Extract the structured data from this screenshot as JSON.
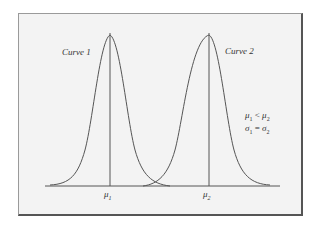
{
  "diagram": {
    "curves": [
      {
        "label": "Curve 1",
        "mean_label": "μ",
        "mean_sub": "1"
      },
      {
        "label": "Curve 2",
        "mean_label": "μ",
        "mean_sub": "2"
      }
    ],
    "annotation": {
      "line1": {
        "a": "μ",
        "a_sub": "1",
        "op": " < ",
        "b": "μ",
        "b_sub": "2"
      },
      "line2": {
        "a": "σ",
        "a_sub": "1",
        "op": " = ",
        "b": "σ",
        "b_sub": "2"
      }
    },
    "colors": {
      "background": "#f3f3f3",
      "line": "#444444",
      "frame": "#555555"
    }
  }
}
